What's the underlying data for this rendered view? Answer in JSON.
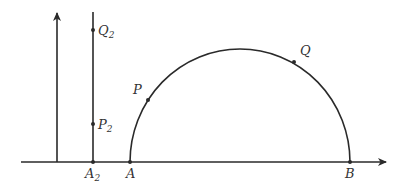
{
  "diagram": {
    "colors": {
      "stroke": "#2a2a2a",
      "text": "#333333",
      "background": "#ffffff"
    },
    "points": {
      "A": {
        "label": "A"
      },
      "B": {
        "label": "B"
      },
      "P": {
        "label": "P"
      },
      "Q": {
        "label": "Q"
      },
      "A2": {
        "label": "A",
        "subscript": "2"
      },
      "P2": {
        "label": "P",
        "subscript": "2"
      },
      "Q2": {
        "label": "Q",
        "subscript": "2"
      }
    }
  }
}
